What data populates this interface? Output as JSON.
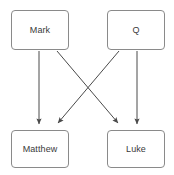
{
  "diagram": {
    "type": "flowchart",
    "background_color": "#ffffff",
    "node_border_color": "#8a8a8a",
    "node_fill_color": "#ffffff",
    "edge_color": "#4a4a4a",
    "text_color": "#3a3a3a",
    "nodes": [
      {
        "id": "mark",
        "label": "Mark",
        "x": 11,
        "y": 10,
        "width": 58,
        "height": 40
      },
      {
        "id": "q",
        "label": "Q",
        "x": 107,
        "y": 10,
        "width": 58,
        "height": 40
      },
      {
        "id": "matthew",
        "label": "Matthew",
        "x": 11,
        "y": 130,
        "width": 58,
        "height": 38
      },
      {
        "id": "luke",
        "label": "Luke",
        "x": 107,
        "y": 130,
        "width": 58,
        "height": 38
      }
    ],
    "edges": [
      {
        "id": "mark-to-matthew",
        "from": "Mark",
        "to": "Matthew",
        "x1": 39,
        "y1": 51,
        "x2": 39,
        "y2": 125,
        "arrowhead": "end"
      },
      {
        "id": "mark-to-luke",
        "from": "Mark",
        "to": "Luke",
        "x1": 57,
        "y1": 51,
        "x2": 119,
        "y2": 125,
        "arrowhead": "end"
      },
      {
        "id": "q-to-matthew",
        "from": "Q",
        "to": "Matthew",
        "x1": 119,
        "y1": 51,
        "x2": 57,
        "y2": 125,
        "arrowhead": "end"
      },
      {
        "id": "q-to-luke",
        "from": "Q",
        "to": "Luke",
        "x1": 137,
        "y1": 51,
        "x2": 137,
        "y2": 125,
        "arrowhead": "end"
      }
    ]
  }
}
